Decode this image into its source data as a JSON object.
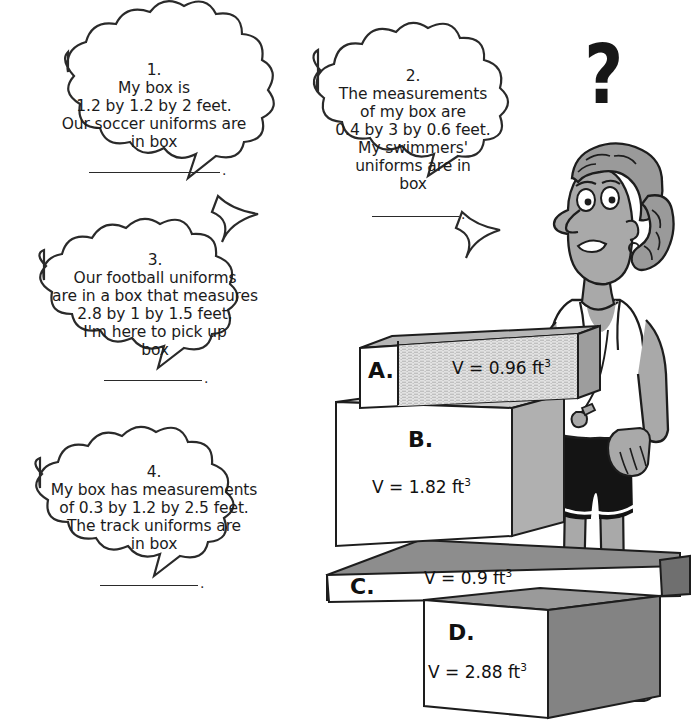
{
  "page": {
    "background_color": "#ffffff",
    "ink_color": "#1b1b1b"
  },
  "question_mark": "?",
  "speech_bubbles": [
    {
      "id": "bubble-1",
      "number": "1.",
      "lines": [
        "My box is",
        "1.2 by 1.2 by 2 feet.",
        "Our soccer uniforms are",
        "in box"
      ],
      "text": "1.\nMy box is\n1.2 by 1.2 by 2 feet.\nOur soccer uniforms are\nin box",
      "answer_blank": "",
      "trailing_punctuation": "."
    },
    {
      "id": "bubble-2",
      "number": "2.",
      "lines": [
        "The measurements",
        "of my box are",
        "0.4 by 3 by 0.6 feet.",
        "My swimmers'",
        "uniforms are in",
        "box"
      ],
      "text": "2.\nThe measurements\nof my box are\n0.4 by 3 by 0.6 feet.\nMy swimmers'\nuniforms are in\nbox",
      "answer_blank": "",
      "trailing_punctuation": "."
    },
    {
      "id": "bubble-3",
      "number": "3.",
      "lines": [
        "Our football uniforms",
        "are in a box that measures",
        "2.8 by 1 by 1.5 feet.",
        "I'm here to pick up",
        "box"
      ],
      "text": "3.\nOur football uniforms\nare in a box that measures\n2.8 by 1 by 1.5 feet.\nI'm here to pick up\nbox",
      "answer_blank": "",
      "trailing_punctuation": "."
    },
    {
      "id": "bubble-4",
      "number": "4.",
      "lines": [
        "My box has measurements",
        "of 0.3 by 1.2 by 2.5 feet.",
        "The track uniforms are",
        "in box"
      ],
      "text": "4.\nMy box has measurements\nof 0.3 by 1.2 by 2.5 feet.\nThe track uniforms are\nin box",
      "answer_blank": "",
      "trailing_punctuation": "."
    }
  ],
  "boxes": [
    {
      "id": "box-a",
      "letter": "A.",
      "volume_label": "V = 0.96 ft",
      "exponent": "3",
      "front_face_color": "#d8d8d8",
      "end_face_color": "#ffffff",
      "top_face_color": "#b6b6b6",
      "texture": "hatched"
    },
    {
      "id": "box-b",
      "letter": "B.",
      "volume_label": "V = 1.82 ft",
      "exponent": "3",
      "front_face_color": "#ffffff",
      "side_face_color": "#b0b0b0",
      "top_face_color": "#d0d0d0"
    },
    {
      "id": "box-c",
      "letter": "C.",
      "volume_label": "V = 0.9 ft",
      "exponent": "3",
      "front_face_color": "#ffffff",
      "top_face_color": "#8d8d8d"
    },
    {
      "id": "box-d",
      "letter": "D.",
      "volume_label": "V = 2.88 ft",
      "exponent": "3",
      "front_face_color": "#ffffff",
      "side_face_color": "#838383",
      "top_face_color": "#9a9a9a"
    }
  ],
  "character": {
    "description": "coach standing behind stacked boxes",
    "skin_color": "#a9a9a9",
    "hair_color": "#9a9a9a",
    "shirt_color": "#ffffff",
    "shorts_color": "#1a1a1a",
    "shoe_color": "#ffffff",
    "whistle": "whistle on cord"
  }
}
